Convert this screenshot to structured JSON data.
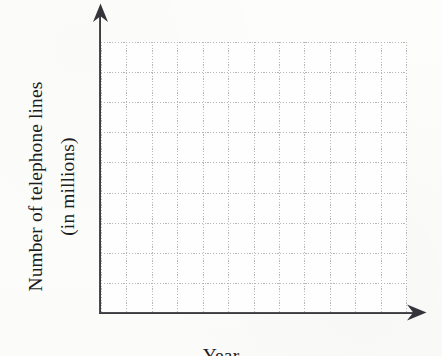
{
  "figure": {
    "kind": "blank-graph-template",
    "background_color": "#fdfdfc",
    "axis_color": "#303034",
    "grid_color": "#b7b7bb",
    "text_color": "#1d1d1d"
  },
  "labels": {
    "y_axis_line1": "Number of telephone lines",
    "y_axis_line2": "(in millions)",
    "x_axis": "Year"
  },
  "icons": {
    "y_arrow": "arrow-up-icon",
    "x_arrow": "arrow-right-icon"
  },
  "chart_data": {
    "type": "line",
    "title": "",
    "subtitle": "",
    "xlabel": "Year",
    "ylabel": "Number of telephone lines (in millions)",
    "x": [],
    "values": [],
    "series": [],
    "categories": [],
    "xtick_labels": [],
    "ytick_labels": [],
    "xlim": null,
    "ylim": null,
    "grid": true,
    "grid_style": "dotted",
    "grid_columns": 12,
    "grid_rows": 9,
    "legend": false,
    "legend_position": "none",
    "annotations": [],
    "note": "Empty graph template: axes drawn with arrowheads and a dotted grid, no plotted data, no tick labels."
  }
}
